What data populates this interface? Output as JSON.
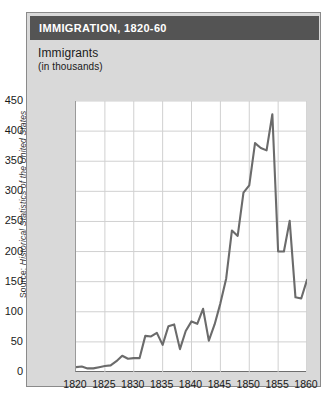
{
  "source_note": {
    "prefix": "Source: ",
    "italic": "Historical Statistics of the United States"
  },
  "card": {
    "title": "IMMIGRATION, 1820-60"
  },
  "axis_title": {
    "line1": "Immigrants",
    "line2": "(in thousands)"
  },
  "colors": {
    "title_bar": "#545454",
    "card_bg": "#d9d9d9",
    "plot_bg": "#ffffff",
    "line": "#6b6b6b",
    "grid": "#d0d0d0",
    "text": "#1a1a1a"
  },
  "chart_data": {
    "type": "line",
    "title": "IMMIGRATION, 1820-60",
    "xlabel": "",
    "ylabel": "Immigrants (in thousands)",
    "xlim": [
      1820,
      1860
    ],
    "ylim": [
      0,
      450
    ],
    "ytick_labels": [
      "0",
      "50",
      "100",
      "150",
      "200",
      "250",
      "300",
      "350",
      "400",
      "450"
    ],
    "yticks": [
      0,
      50,
      100,
      150,
      200,
      250,
      300,
      350,
      400,
      450
    ],
    "xtick_labels": [
      "1820",
      "1825",
      "1830",
      "1835",
      "1840",
      "1845",
      "1850",
      "1855",
      "1860"
    ],
    "xticks": [
      1820,
      1825,
      1830,
      1835,
      1840,
      1845,
      1850,
      1855,
      1860
    ],
    "grid": true,
    "legend": null,
    "series": [
      {
        "name": "Immigrants",
        "color": "#6b6b6b",
        "x": [
          1820,
          1821,
          1822,
          1823,
          1824,
          1825,
          1826,
          1827,
          1828,
          1829,
          1830,
          1831,
          1832,
          1833,
          1834,
          1835,
          1836,
          1837,
          1838,
          1839,
          1840,
          1841,
          1842,
          1843,
          1844,
          1845,
          1846,
          1847,
          1848,
          1849,
          1850,
          1851,
          1852,
          1853,
          1854,
          1855,
          1856,
          1857,
          1858,
          1859,
          1860
        ],
        "values": [
          8,
          9,
          6,
          6,
          8,
          10,
          11,
          18,
          27,
          22,
          23,
          23,
          60,
          59,
          65,
          45,
          76,
          79,
          38,
          68,
          84,
          80,
          105,
          52,
          79,
          114,
          155,
          235,
          226,
          298,
          310,
          380,
          372,
          368,
          428,
          200,
          200,
          251,
          124,
          122,
          153
        ]
      }
    ]
  }
}
